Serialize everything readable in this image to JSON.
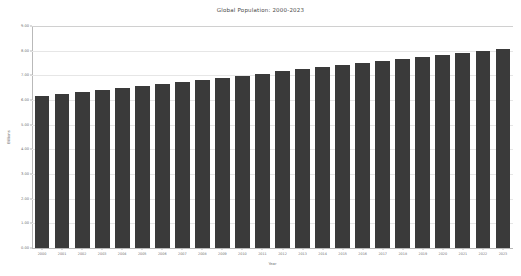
{
  "chart_data": {
    "type": "bar",
    "title": "Global Population: 2000-2023",
    "xlabel": "Year",
    "ylabel": "Billions",
    "ylim": [
      0,
      9
    ],
    "ytick_step": 1,
    "grid": true,
    "legend": null,
    "bar_color": "#3a3a3a",
    "categories": [
      "2000",
      "2001",
      "2002",
      "2003",
      "2004",
      "2005",
      "2006",
      "2007",
      "2008",
      "2009",
      "2010",
      "2011",
      "2012",
      "2013",
      "2014",
      "2015",
      "2016",
      "2017",
      "2018",
      "2019",
      "2020",
      "2021",
      "2022",
      "2023"
    ],
    "values": [
      6.15,
      6.23,
      6.31,
      6.4,
      6.48,
      6.56,
      6.64,
      6.73,
      6.81,
      6.9,
      6.99,
      7.07,
      7.16,
      7.25,
      7.34,
      7.43,
      7.51,
      7.6,
      7.68,
      7.76,
      7.82,
      7.89,
      7.97,
      8.05
    ],
    "ytick_labels": [
      "0.00",
      "1.00",
      "2.00",
      "3.00",
      "4.00",
      "5.00",
      "6.00",
      "7.00",
      "8.00",
      "9.00"
    ]
  }
}
